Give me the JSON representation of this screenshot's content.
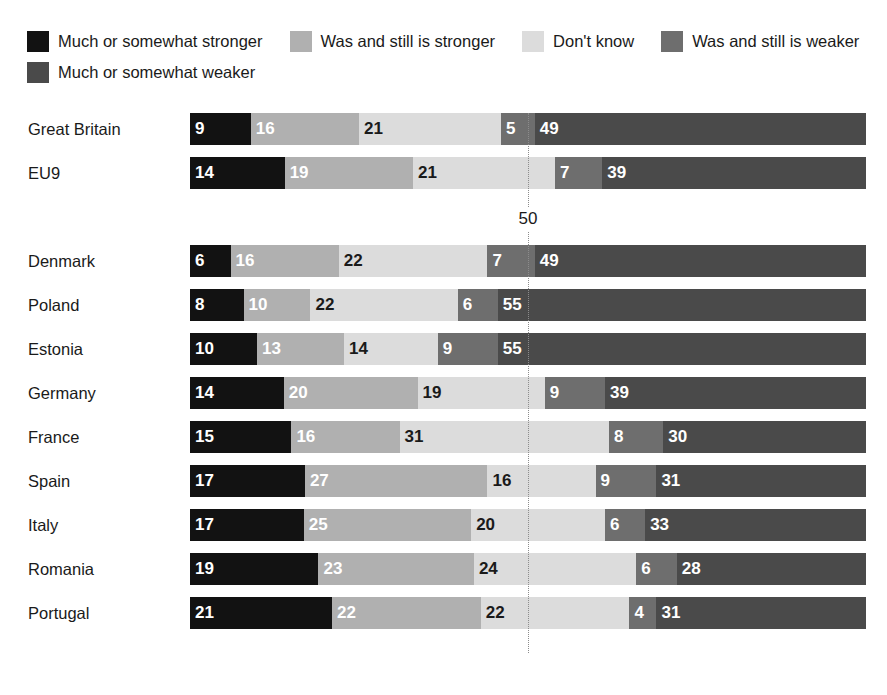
{
  "clipped_top_text": "",
  "legend": {
    "rows": [
      [
        {
          "label": "Much or somewhat stronger",
          "color": "#121212"
        },
        {
          "label": "Was and still is stronger",
          "color": "#b0b0b0"
        },
        {
          "label": "Don't know",
          "color": "#dcdcdc"
        },
        {
          "label": "Was and still is weaker",
          "color": "#6e6e6e"
        }
      ],
      [
        {
          "label": "Much or somewhat weaker",
          "color": "#4a4a4a"
        }
      ]
    ]
  },
  "midline": {
    "label": "50",
    "value": 50
  },
  "chart_data": {
    "type": "bar",
    "orientation": "horizontal",
    "stacked": true,
    "title": "",
    "xlabel": "",
    "ylabel": "",
    "xlim": [
      0,
      100
    ],
    "grid": false,
    "legend_position": "top",
    "reference_line": 50,
    "categories": [
      "Great Britain",
      "EU9",
      "Denmark",
      "Poland",
      "Estonia",
      "Germany",
      "France",
      "Spain",
      "Italy",
      "Romania",
      "Portugal"
    ],
    "series": [
      {
        "name": "Much or somewhat stronger",
        "color": "#121212",
        "text_color": "#ffffff",
        "values": [
          9,
          14,
          6,
          8,
          10,
          14,
          15,
          17,
          17,
          19,
          21
        ]
      },
      {
        "name": "Was and still is stronger",
        "color": "#b0b0b0",
        "text_color": "#ffffff",
        "values": [
          16,
          19,
          16,
          10,
          13,
          20,
          16,
          27,
          25,
          23,
          22
        ]
      },
      {
        "name": "Don't know",
        "color": "#dcdcdc",
        "text_color": "#1a1a1a",
        "values": [
          21,
          21,
          22,
          22,
          14,
          19,
          31,
          16,
          20,
          24,
          22
        ]
      },
      {
        "name": "Was and still is weaker",
        "color": "#6e6e6e",
        "text_color": "#ffffff",
        "values": [
          5,
          7,
          7,
          6,
          9,
          9,
          8,
          9,
          6,
          6,
          4
        ]
      },
      {
        "name": "Much or somewhat weaker",
        "color": "#4a4a4a",
        "text_color": "#ffffff",
        "values": [
          49,
          39,
          49,
          55,
          55,
          39,
          30,
          31,
          33,
          28,
          31
        ]
      }
    ],
    "rows": [
      {
        "label": "Great Britain",
        "values": [
          9,
          16,
          21,
          5,
          49
        ]
      },
      {
        "label": "EU9",
        "values": [
          14,
          19,
          21,
          7,
          39
        ]
      },
      {
        "label": "Denmark",
        "values": [
          6,
          16,
          22,
          7,
          49
        ]
      },
      {
        "label": "Poland",
        "values": [
          8,
          10,
          22,
          6,
          55
        ]
      },
      {
        "label": "Estonia",
        "values": [
          10,
          13,
          14,
          9,
          55
        ]
      },
      {
        "label": "Germany",
        "values": [
          14,
          20,
          19,
          9,
          39
        ]
      },
      {
        "label": "France",
        "values": [
          15,
          16,
          31,
          8,
          30
        ]
      },
      {
        "label": "Spain",
        "values": [
          17,
          27,
          16,
          9,
          31
        ]
      },
      {
        "label": "Italy",
        "values": [
          17,
          25,
          20,
          6,
          33
        ]
      },
      {
        "label": "Romania",
        "values": [
          19,
          23,
          24,
          6,
          28
        ]
      },
      {
        "label": "Portugal",
        "values": [
          21,
          22,
          22,
          4,
          31
        ]
      }
    ]
  }
}
